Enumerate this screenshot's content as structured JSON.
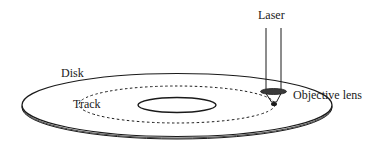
{
  "diagram": {
    "type": "optical-disk-schematic",
    "labels": {
      "laser": "Laser",
      "disk": "Disk",
      "track": "Track",
      "objective_lens": "Objective lens"
    },
    "colors": {
      "stroke": "#1a1a1a",
      "background": "#ffffff",
      "lens_fill": "#3a3a3a"
    }
  }
}
